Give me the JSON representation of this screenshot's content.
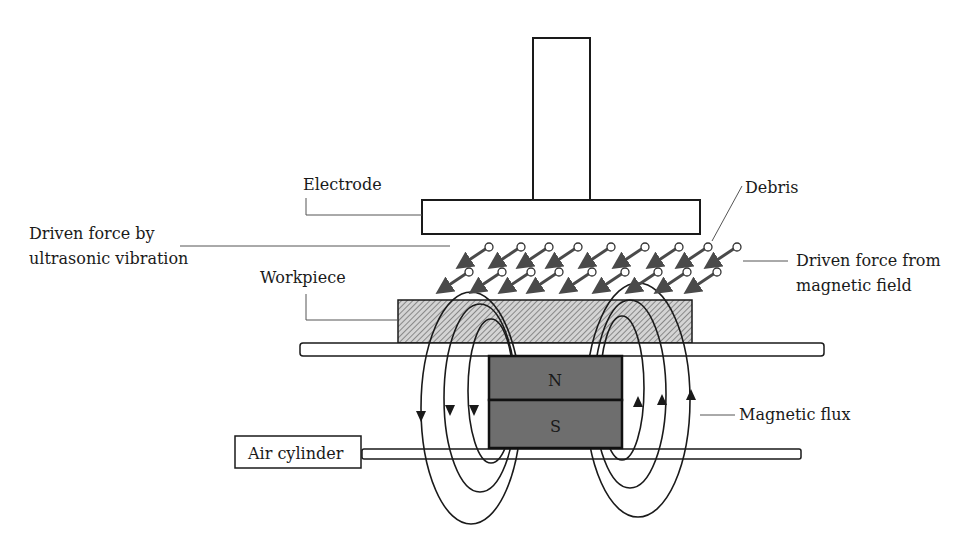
{
  "diagram": {
    "type": "schematic",
    "labels": {
      "electrode": "Electrode",
      "debris": "Debris",
      "ultrasonic_line1": "Driven force by",
      "ultrasonic_line2": "ultrasonic vibration",
      "magnetic_line1": "Driven force from",
      "magnetic_line2": "magnetic field",
      "workpiece": "Workpiece",
      "magnetic_flux": "Magnetic flux",
      "air_cylinder": "Air cylinder",
      "north": "N",
      "south": "S"
    },
    "colors": {
      "stroke": "#1a1a1a",
      "magnet_fill": "#6e6e6e",
      "workpiece_hatch": "#555555",
      "workpiece_bg": "#cfcfcf",
      "arrow": "#4a4a4a",
      "leader": "#777777"
    }
  }
}
